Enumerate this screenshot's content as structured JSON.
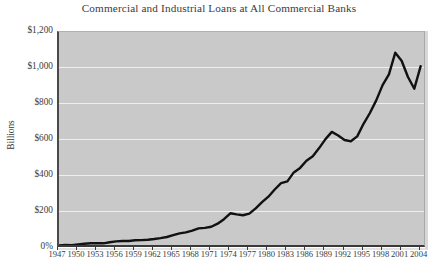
{
  "chart_data": {
    "type": "line",
    "title": "Commercial and Industrial Loans at All Commercial Banks",
    "xlabel": "",
    "ylabel": "Billions",
    "xlim": [
      1947,
      2005
    ],
    "ylim": [
      0,
      1200
    ],
    "grid": true,
    "legend": null,
    "y_ticks": [
      {
        "value": 1200,
        "label": "$1,200"
      },
      {
        "value": 1000,
        "label": "$1,000"
      },
      {
        "value": 800,
        "label": "$800"
      },
      {
        "value": 600,
        "label": "$600"
      },
      {
        "value": 400,
        "label": "$400"
      },
      {
        "value": 200,
        "label": "$200"
      },
      {
        "value": 0,
        "label": "0%"
      }
    ],
    "x_ticks": [
      "1947",
      "1950",
      "1953",
      "1956",
      "1959",
      "1962",
      "1965",
      "1968",
      "1971",
      "1974",
      "1977",
      "1980",
      "1983",
      "1986",
      "1989",
      "1992",
      "1995",
      "1998",
      "2001",
      "2004"
    ],
    "series": [
      {
        "name": "Commercial and Industrial Loans",
        "color": "#111111",
        "x": [
          1947,
          1948,
          1949,
          1950,
          1951,
          1952,
          1953,
          1954,
          1955,
          1956,
          1957,
          1958,
          1959,
          1960,
          1961,
          1962,
          1963,
          1964,
          1965,
          1966,
          1967,
          1968,
          1969,
          1970,
          1971,
          1972,
          1973,
          1974,
          1975,
          1976,
          1977,
          1978,
          1979,
          1980,
          1981,
          1982,
          1983,
          1984,
          1985,
          1986,
          1987,
          1988,
          1989,
          1990,
          1991,
          1992,
          1993,
          1994,
          1995,
          1996,
          1997,
          1998,
          1999,
          2000,
          2001,
          2002,
          2003,
          2004
        ],
        "values": [
          14,
          17,
          16,
          20,
          24,
          26,
          27,
          26,
          32,
          37,
          39,
          39,
          43,
          44,
          46,
          50,
          55,
          61,
          71,
          81,
          87,
          97,
          109,
          112,
          118,
          135,
          160,
          193,
          187,
          182,
          191,
          220,
          255,
          285,
          325,
          360,
          370,
          420,
          445,
          485,
          510,
          555,
          605,
          645,
          625,
          600,
          593,
          620,
          690,
          750,
          820,
          905,
          965,
          1085,
          1040,
          950,
          885,
          1010
        ]
      }
    ],
    "annotations": [
      {
        "note": "plateau near $190B around 1974-1976"
      },
      {
        "note": "local peak near $645B in 1990, trough near $593B in 1993"
      },
      {
        "note": "peak near $1,085B in 2000, trough near $885B in 2003"
      }
    ]
  },
  "colors": {
    "plot_background": "#c9c9c9",
    "gridline": "#efefef",
    "axis": "#3a3a3a",
    "series": "#111111",
    "page_background": "#ffffff",
    "text": "#3a3a3a"
  }
}
